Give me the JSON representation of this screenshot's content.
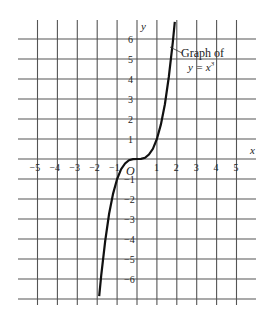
{
  "chart_data": {
    "type": "line",
    "title": "",
    "xlabel": "x",
    "ylabel": "y",
    "origin_label": "O",
    "xlim": [
      -5.9,
      5.9
    ],
    "ylim": [
      -7.2,
      7.0
    ],
    "grid": true,
    "x_ticks": [
      -5,
      -4,
      -3,
      -2,
      -1,
      1,
      2,
      3,
      4,
      5
    ],
    "x_tick_labels": [
      "−5",
      "−4",
      "−3",
      "−2",
      "−1",
      "1",
      "2",
      "3",
      "4",
      "5"
    ],
    "y_ticks": [
      6,
      5,
      4,
      3,
      2,
      1,
      -1,
      -2,
      -3,
      -4,
      -5,
      -6
    ],
    "y_tick_labels": [
      "6",
      "5",
      "4",
      "3",
      "2",
      "1",
      "−1",
      "−2",
      "−3",
      "−4",
      "−5",
      "−6"
    ],
    "series": [
      {
        "name": "y = x^3",
        "x": [
          -1.9,
          -1.8,
          -1.6,
          -1.4,
          -1.2,
          -1.0,
          -0.8,
          -0.6,
          -0.4,
          -0.2,
          0,
          0.2,
          0.4,
          0.6,
          0.8,
          1.0,
          1.2,
          1.4,
          1.6,
          1.8,
          1.9
        ],
        "y": [
          -6.86,
          -5.83,
          -4.1,
          -2.74,
          -1.73,
          -1.0,
          -0.51,
          -0.22,
          -0.06,
          -0.01,
          0,
          0.01,
          0.06,
          0.22,
          0.51,
          1.0,
          1.73,
          2.74,
          4.1,
          5.83,
          6.86
        ]
      }
    ],
    "annotations": [
      {
        "text_line1": "Graph of",
        "text_line2": "y = x³",
        "arrow_to": [
          1.75,
          5.7
        ]
      }
    ]
  },
  "labels": {
    "x_axis": "x",
    "y_axis": "y",
    "origin": "O",
    "annotation_line1": "Graph of",
    "annotation_line2_prefix": "y = x",
    "annotation_line2_exp": "3"
  }
}
